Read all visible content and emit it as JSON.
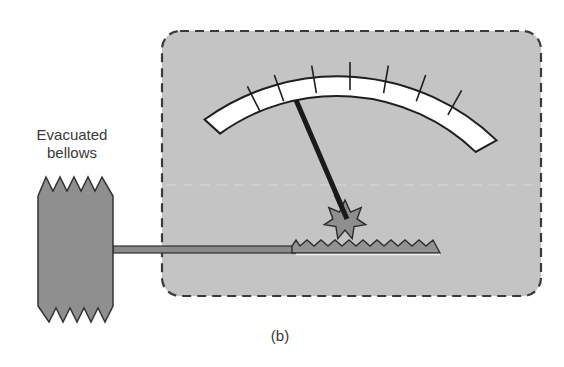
{
  "figure": {
    "caption": "(b)",
    "bellows_label_line1": "Evacuated",
    "bellows_label_line2": "bellows"
  },
  "components": {
    "bellows": {
      "name": "Evacuated bellows",
      "fill": "#8f8f8f",
      "stroke": "#333333"
    },
    "gauge_housing": {
      "fill": "#c4c4c4",
      "stroke": "#3a3a3a",
      "style": "dashed rounded rectangle"
    },
    "dial_scale": {
      "fill": "#ffffff",
      "stroke": "#1e1e1e",
      "tick_count": 9
    },
    "needle": {
      "color": "#1a1a1a"
    },
    "pinion_gear": {
      "points": 9,
      "fill": "#8e8e8e"
    },
    "rack": {
      "fill": "#939393"
    },
    "rod": {
      "fill": "#8a8a8a"
    }
  }
}
